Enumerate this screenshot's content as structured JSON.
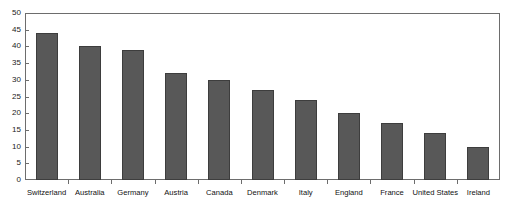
{
  "figure": {
    "top_cut_text": "·           ··              ·                      ··      ·                              ·",
    "background_color": "#ffffff",
    "frame_color": "#6d6d6d"
  },
  "chart_data": {
    "type": "bar",
    "title": "",
    "subtitle": "",
    "xlabel": "",
    "ylabel": "",
    "categories": [
      "Switzerland",
      "Australia",
      "Germany",
      "Austria",
      "Canada",
      "Denmark",
      "Italy",
      "England",
      "France",
      "United States",
      "Ireland"
    ],
    "values": [
      44,
      40,
      39,
      32,
      30,
      27,
      24,
      20,
      17,
      14,
      10
    ],
    "ylim": [
      0,
      50
    ],
    "yticks": [
      0,
      5,
      10,
      15,
      20,
      25,
      30,
      35,
      40,
      45,
      50
    ],
    "ytick_labels": [
      "0",
      "5",
      "10",
      "15",
      "20",
      "25",
      "30",
      "35",
      "40",
      "45",
      "50"
    ],
    "grid": false,
    "legend": null,
    "legend_position": "none",
    "bar_color": "#585858",
    "bar_edge_color": "#3d3d3d",
    "orientation": "vertical",
    "annotations": []
  }
}
